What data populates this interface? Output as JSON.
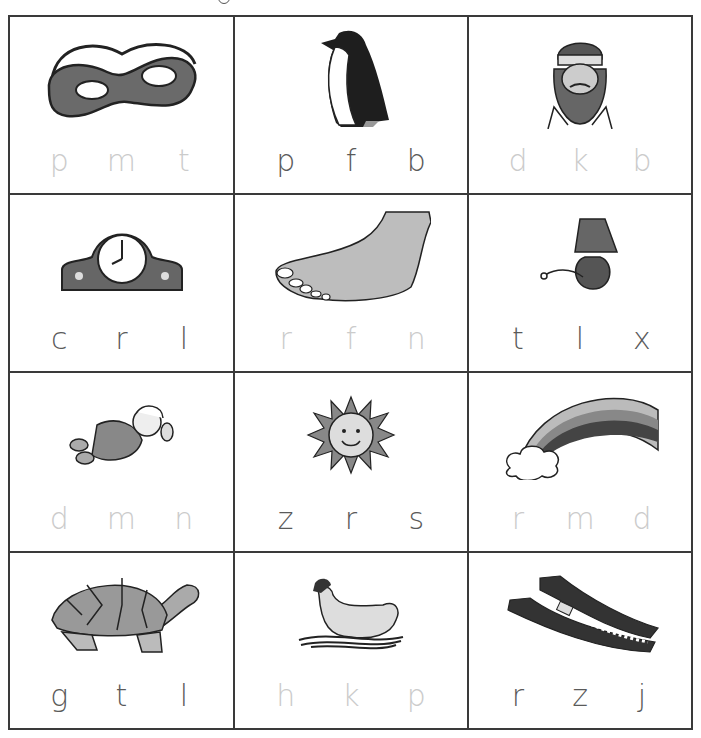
{
  "worksheet": {
    "colors": {
      "grid_line": "#3a3a3a",
      "letter_dark": "#5a5a5a",
      "letter_faint": "#cbcbcb"
    },
    "cells": [
      {
        "picture": "mask",
        "letters": [
          "p",
          "m",
          "t"
        ],
        "shade": "faint"
      },
      {
        "picture": "penguin",
        "letters": [
          "p",
          "f",
          "b"
        ],
        "shade": "dark"
      },
      {
        "picture": "king",
        "letters": [
          "d",
          "k",
          "b"
        ],
        "shade": "faint"
      },
      {
        "picture": "clock",
        "letters": [
          "c",
          "r",
          "l"
        ],
        "shade": "dark"
      },
      {
        "picture": "foot",
        "letters": [
          "r",
          "f",
          "n"
        ],
        "shade": "faint"
      },
      {
        "picture": "lamp",
        "letters": [
          "t",
          "l",
          "x"
        ],
        "shade": "dark"
      },
      {
        "picture": "doll",
        "letters": [
          "d",
          "m",
          "n"
        ],
        "shade": "faint"
      },
      {
        "picture": "sun",
        "letters": [
          "z",
          "r",
          "s"
        ],
        "shade": "dark"
      },
      {
        "picture": "rainbow",
        "letters": [
          "r",
          "m",
          "d"
        ],
        "shade": "faint"
      },
      {
        "picture": "turtle",
        "letters": [
          "g",
          "t",
          "l"
        ],
        "shade": "dark"
      },
      {
        "picture": "hen",
        "letters": [
          "h",
          "k",
          "p"
        ],
        "shade": "faint"
      },
      {
        "picture": "zipper",
        "letters": [
          "r",
          "z",
          "j"
        ],
        "shade": "dark"
      }
    ]
  }
}
